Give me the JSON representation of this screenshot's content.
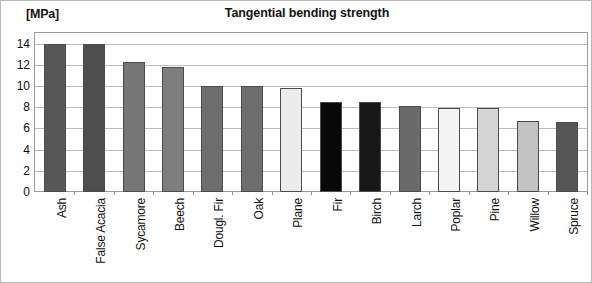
{
  "chart": {
    "title": "Tangential bending strength",
    "unit_label": "[MPa]"
  },
  "chart_data": {
    "type": "bar",
    "title": "Tangential bending strength",
    "xlabel": "",
    "ylabel": "[MPa]",
    "ylim": [
      0,
      15
    ],
    "yticks": [
      0,
      2,
      4,
      6,
      8,
      10,
      12,
      14
    ],
    "grid": true,
    "legend": "none",
    "orientation": "vertical",
    "categories": [
      "Ash",
      "False Acacia",
      "Sycamore",
      "Beech",
      "Dougl. Fir",
      "Oak",
      "Plane",
      "Fir",
      "Birch",
      "Larch",
      "Poplar",
      "Pine",
      "Willow",
      "Spruce"
    ],
    "values": [
      14.0,
      14.0,
      12.3,
      11.8,
      10.0,
      10.0,
      9.8,
      8.5,
      8.5,
      8.1,
      7.9,
      7.9,
      6.7,
      6.6
    ],
    "bar_colors": [
      "#585858",
      "#4e4e4e",
      "#767676",
      "#7e7e7e",
      "#6e6e6e",
      "#6e6e6e",
      "#ececec",
      "#080808",
      "#171717",
      "#6a6a6a",
      "#f4f4f4",
      "#d4d4d4",
      "#c2c2c2",
      "#565656"
    ],
    "bar_border_color": "#4b4b4b",
    "plot_background": "#ffffff",
    "gridline_color": "#bdbdbd"
  }
}
